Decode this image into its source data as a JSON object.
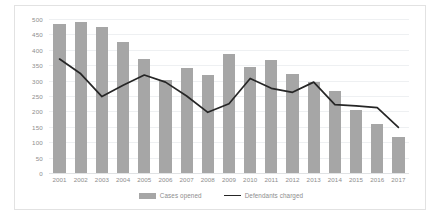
{
  "chart_data": {
    "type": "bar",
    "title": "",
    "subtitle": "",
    "xlabel": "",
    "ylabel": "",
    "ylim": [
      0,
      500
    ],
    "ytick_step": 50,
    "yticks": [
      500,
      450,
      400,
      350,
      300,
      250,
      200,
      150,
      100,
      50,
      0
    ],
    "grid": true,
    "legend_position": "bottom",
    "categories": [
      "2001",
      "2002",
      "2003",
      "2004",
      "2005",
      "2006",
      "2007",
      "2008",
      "2009",
      "2010",
      "2011",
      "2012",
      "2013",
      "2014",
      "2015",
      "2016",
      "2017"
    ],
    "series": [
      {
        "name": "Cases opened",
        "type": "bar",
        "color": "#a6a6a6",
        "values": [
          485,
          490,
          473,
          425,
          370,
          303,
          340,
          318,
          385,
          345,
          367,
          320,
          295,
          265,
          205,
          160,
          118
        ]
      },
      {
        "name": "Defendants charged",
        "type": "line",
        "color": "#262626",
        "values": [
          370,
          322,
          248,
          285,
          318,
          295,
          250,
          197,
          225,
          307,
          275,
          262,
          295,
          222,
          218,
          212,
          148
        ]
      }
    ]
  },
  "legend": {
    "items": [
      {
        "label": "Cases opened",
        "marker": "bar-swatch"
      },
      {
        "label": "Defendants charged",
        "marker": "line-swatch"
      }
    ]
  },
  "colors": {
    "bar": "#a6a6a6",
    "line": "#262626",
    "gridline": "#eef0f2",
    "axis_text": "#8d8d8d",
    "frame_border": "#e2e2e2",
    "background": "#ffffff"
  }
}
